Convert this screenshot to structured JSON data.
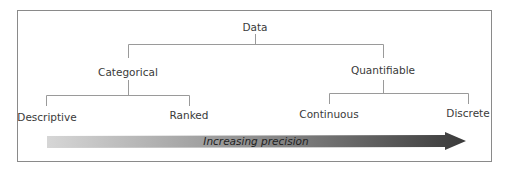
{
  "diagram": {
    "root": "Data",
    "branches": [
      {
        "label": "Categorical",
        "children": [
          "Descriptive",
          "Ranked"
        ]
      },
      {
        "label": "Quantifiable",
        "children": [
          "Continuous",
          "Discrete"
        ]
      }
    ],
    "arrow_label": "Increasing precision",
    "colors": {
      "line": "#9a9a9a",
      "frame": "#8a8a8a",
      "arrow_start": "#d4d4d4",
      "arrow_end": "#3e3e3e",
      "text": "#3a3a3a"
    }
  }
}
